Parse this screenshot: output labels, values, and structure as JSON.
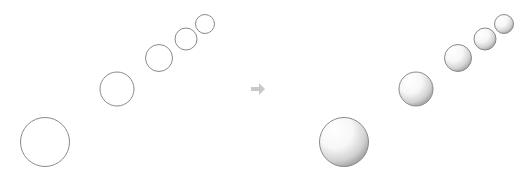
{
  "diagram": {
    "colors": {
      "background": "#ffffff",
      "outline": "#8a8a8a",
      "arrow": "#c8c8c8",
      "shade_light": "#ffffff",
      "shade_dark": "#9a9a9a"
    },
    "before": {
      "label": "flat circles",
      "circles": [
        {
          "cx": 45,
          "cy": 142,
          "r": 24.5
        },
        {
          "cx": 117,
          "cy": 89,
          "r": 17
        },
        {
          "cx": 159,
          "cy": 58,
          "r": 13.5
        },
        {
          "cx": 186,
          "cy": 39,
          "r": 11
        },
        {
          "cx": 205,
          "cy": 24,
          "r": 9.5
        }
      ]
    },
    "arrow": {
      "icon": "right-arrow-icon",
      "x": 258,
      "y": 89
    },
    "after": {
      "label": "shaded spheres",
      "circles": [
        {
          "cx": 344,
          "cy": 142,
          "r": 24.5
        },
        {
          "cx": 416,
          "cy": 89,
          "r": 17
        },
        {
          "cx": 458,
          "cy": 58,
          "r": 13.5
        },
        {
          "cx": 485,
          "cy": 39,
          "r": 11
        },
        {
          "cx": 504,
          "cy": 24,
          "r": 9.5
        }
      ]
    }
  }
}
